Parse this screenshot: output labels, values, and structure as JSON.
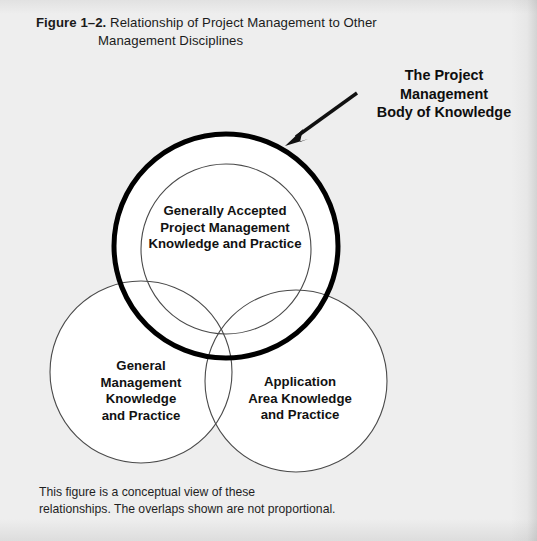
{
  "figure": {
    "number_label": "Figure 1–2.",
    "caption_line1": "Relationship of Project Management to Other",
    "caption_line2": "Management Disciplines"
  },
  "callout": {
    "line1": "The Project",
    "line2": "Management",
    "line3": "Body of Knowledge"
  },
  "circles": {
    "pmbok_outer": {
      "name": "The Project Management Body of Knowledge",
      "cx": 226,
      "cy": 246,
      "r": 112,
      "stroke": "#000000",
      "stroke_width": 5,
      "fill": "#ffffff"
    },
    "generally_accepted": {
      "label_line1": "Generally Accepted",
      "label_line2": "Project Management",
      "label_line3": "Knowledge and Practice",
      "cx": 226,
      "cy": 249,
      "r": 85,
      "stroke": "#4a4a4a",
      "stroke_width": 1,
      "fill": "none"
    },
    "general_management": {
      "label_line1": "General",
      "label_line2": "Management",
      "label_line3": "Knowledge",
      "label_line4": "and Practice",
      "cx": 141,
      "cy": 372,
      "r": 91,
      "stroke": "#4a4a4a",
      "stroke_width": 1,
      "fill": "none"
    },
    "application_area": {
      "label_line1": "Application",
      "label_line2": "Area Knowledge",
      "label_line3": "and Practice",
      "cx": 296,
      "cy": 381,
      "r": 91,
      "stroke": "#4a4a4a",
      "stroke_width": 1,
      "fill": "none"
    }
  },
  "arrow": {
    "name": "callout-arrow",
    "from_x": 357,
    "from_y": 93,
    "to_x": 287,
    "to_y": 143,
    "color": "#111111"
  },
  "footnote": {
    "line1": "This figure is a conceptual view of these",
    "line2": "relationships. The overlaps shown are not proportional."
  },
  "colors": {
    "page_background": "#eeeeee",
    "circle_fill": "#ffffff",
    "bold_outline": "#000000",
    "thin_outline": "#4a4a4a",
    "text": "#121212"
  }
}
